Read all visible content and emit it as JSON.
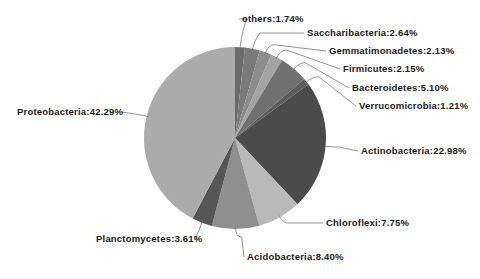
{
  "chart_data": {
    "type": "pie",
    "title": "",
    "start_angle_deg": 0,
    "direction": "clockwise",
    "center": [
      235,
      138
    ],
    "radius": 91,
    "slices": [
      {
        "name": "others",
        "value": 1.74,
        "label": "others:1.74%",
        "color": "#6b6b6b"
      },
      {
        "name": "Saccharibacteria",
        "value": 2.64,
        "label": "Saccharibacteria:2.64%",
        "color": "#7a7a7a"
      },
      {
        "name": "Gemmatimonadetes",
        "value": 2.13,
        "label": "Gemmatimonadetes:2.13%",
        "color": "#8c8c8c"
      },
      {
        "name": "Firmicutes",
        "value": 2.15,
        "label": "Firmicutes:2.15%",
        "color": "#a3a3a3"
      },
      {
        "name": "Bacteroidetes",
        "value": 5.1,
        "label": "Bacteroidetes:5.10%",
        "color": "#707070"
      },
      {
        "name": "Verrucomicrobia",
        "value": 1.21,
        "label": "Verrucomicrobia:1.21%",
        "color": "#5c5c5c"
      },
      {
        "name": "Actinobacteria",
        "value": 22.98,
        "label": "Actinobacteria:22.98%",
        "color": "#4b4b4b"
      },
      {
        "name": "Chloroflexi",
        "value": 7.75,
        "label": "Chloroflexi:7.75%",
        "color": "#b9b9b9"
      },
      {
        "name": "Acidobacteria",
        "value": 8.4,
        "label": "Acidobacteria:8.40%",
        "color": "#8f8f8f"
      },
      {
        "name": "Planctomycetes",
        "value": 3.61,
        "label": "Planctomycetes:3.61%",
        "color": "#565656"
      },
      {
        "name": "Proteobacteria",
        "value": 42.29,
        "label": "Proteobacteria:42.29%",
        "color": "#ababab"
      }
    ],
    "labels_layout": [
      {
        "x": 242,
        "y": 13,
        "anchor": "start"
      },
      {
        "x": 307,
        "y": 27,
        "anchor": "start"
      },
      {
        "x": 329,
        "y": 45,
        "anchor": "start"
      },
      {
        "x": 343,
        "y": 63,
        "anchor": "start"
      },
      {
        "x": 352,
        "y": 82,
        "anchor": "start"
      },
      {
        "x": 359,
        "y": 100,
        "anchor": "start"
      },
      {
        "x": 361,
        "y": 145,
        "anchor": "start"
      },
      {
        "x": 326,
        "y": 217,
        "anchor": "start"
      },
      {
        "x": 247,
        "y": 251,
        "anchor": "start"
      },
      {
        "x": 96,
        "y": 233,
        "anchor": "start"
      },
      {
        "x": 17,
        "y": 106,
        "anchor": "start"
      }
    ],
    "legend": "none"
  }
}
